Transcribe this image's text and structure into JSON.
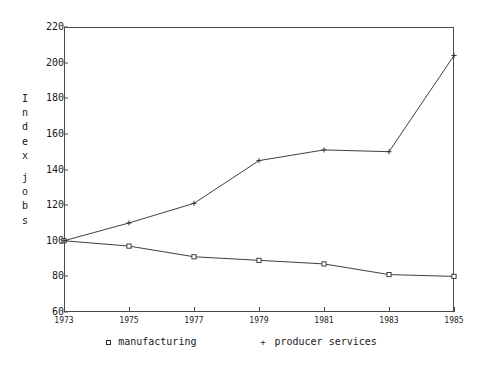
{
  "chart_data": {
    "type": "line",
    "title": "",
    "subtitle": "",
    "xlabel": "",
    "ylabel": "Index jobs",
    "ylabel_chars": [
      "I",
      "n",
      "d",
      "e",
      "x",
      "",
      "j",
      "o",
      "b",
      "s"
    ],
    "x": [
      1973,
      1975,
      1977,
      1979,
      1981,
      1983,
      1985
    ],
    "categories": [
      "1973",
      "1975",
      "1977",
      "1979",
      "1981",
      "1983",
      "1985"
    ],
    "xlim": [
      1973,
      1985
    ],
    "ylim": [
      60,
      220
    ],
    "yticks": [
      220,
      200,
      180,
      160,
      140,
      120,
      100,
      80,
      60
    ],
    "xticks": [
      1973,
      1975,
      1977,
      1979,
      1981,
      1983,
      1985
    ],
    "grid": false,
    "legend_position": "bottom",
    "series": [
      {
        "name": "manufacturing",
        "marker": "square",
        "marker_glyph": "□",
        "color": "#2a2a2a",
        "values": [
          100,
          97,
          91,
          89,
          87,
          81,
          80
        ]
      },
      {
        "name": "producer services",
        "marker": "plus",
        "marker_glyph": "+",
        "color": "#2a2a2a",
        "values": [
          100,
          110,
          121,
          145,
          151,
          150,
          204
        ]
      }
    ]
  },
  "legend": {
    "items": [
      {
        "marker": "□",
        "label": "manufacturing"
      },
      {
        "marker": "+",
        "label": "producer services"
      }
    ]
  },
  "colors": {
    "axis": "#4a4a4a",
    "line": "#2a2a2a",
    "text": "#1a1a1a",
    "background": "#ffffff"
  }
}
